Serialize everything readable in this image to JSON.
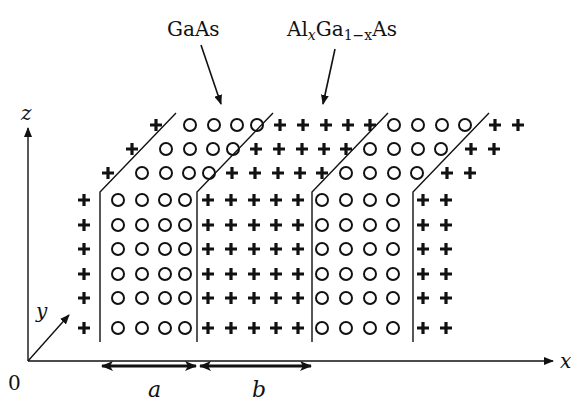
{
  "diagram": {
    "labels": {
      "material_1": "GaAs",
      "material_2_parts": {
        "a": "Al",
        "x1": "x",
        "b": "Ga",
        "sub": "1−x",
        "c": "As"
      },
      "axis_x": "x",
      "axis_y": "y",
      "axis_z": "z",
      "origin": "0",
      "width_a": "a",
      "width_b": "b"
    },
    "legend_semantics": {
      "circle": "GaAs lattice site (well)",
      "plus": "AlxGa1-xAs lattice site (barrier)"
    },
    "layers": [
      {
        "name": "barrier-left",
        "symbol": "plus",
        "columns": 1
      },
      {
        "name": "GaAs-well-1",
        "symbol": "circle",
        "columns": 4,
        "width_label": "a"
      },
      {
        "name": "AlGaAs-barrier",
        "symbol": "plus",
        "columns": 5,
        "width_label": "b"
      },
      {
        "name": "GaAs-well-2",
        "symbol": "circle",
        "columns": 4
      },
      {
        "name": "barrier-right",
        "symbol": "plus",
        "columns": 2
      }
    ],
    "front_rows": 6,
    "depth_rows": 3,
    "colors": {
      "ink": "#111111",
      "background": "#ffffff"
    }
  }
}
